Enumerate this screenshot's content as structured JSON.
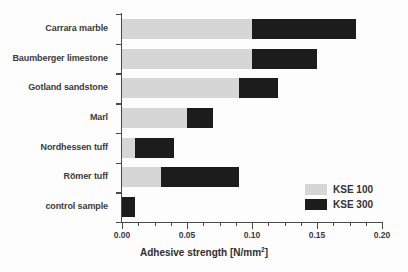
{
  "chart_data": {
    "type": "bar",
    "orientation": "horizontal",
    "stacked": true,
    "title": "",
    "xlabel": "Adhesive strength [N/mm2]",
    "xlabel_main": "Adhesive strength [N/mm",
    "xlabel_sup": "2",
    "xlabel_close": "]",
    "ylabel": "",
    "categories": [
      "Carrara marble",
      "Baumberger limestone",
      "Gotland sandstone",
      "Marl",
      "Nordhessen tuff",
      "Römer tuff",
      "control sample"
    ],
    "series": [
      {
        "name": "KSE 100",
        "color": "#d6d6d6",
        "values": [
          0.1,
          0.1,
          0.09,
          0.05,
          0.01,
          0.03,
          0.0
        ]
      },
      {
        "name": "KSE 300",
        "color": "#1c1c1c",
        "values": [
          0.08,
          0.05,
          0.03,
          0.02,
          0.03,
          0.06,
          0.01
        ]
      }
    ],
    "totals": [
      0.18,
      0.15,
      0.12,
      0.07,
      0.04,
      0.09,
      0.01
    ],
    "xlim": [
      0.0,
      0.2
    ],
    "xticks": [
      0.0,
      0.05,
      0.1,
      0.15,
      0.2
    ],
    "xtick_labels": [
      "0.00",
      "0.05",
      "0.10",
      "0.15",
      "0.20"
    ],
    "xminor_step": 0.0125,
    "grid": false,
    "legend_position": "bottom-right"
  },
  "legend": {
    "items": [
      {
        "label": "KSE 100",
        "color": "#d6d6d6"
      },
      {
        "label": "KSE 300",
        "color": "#1c1c1c"
      }
    ]
  }
}
